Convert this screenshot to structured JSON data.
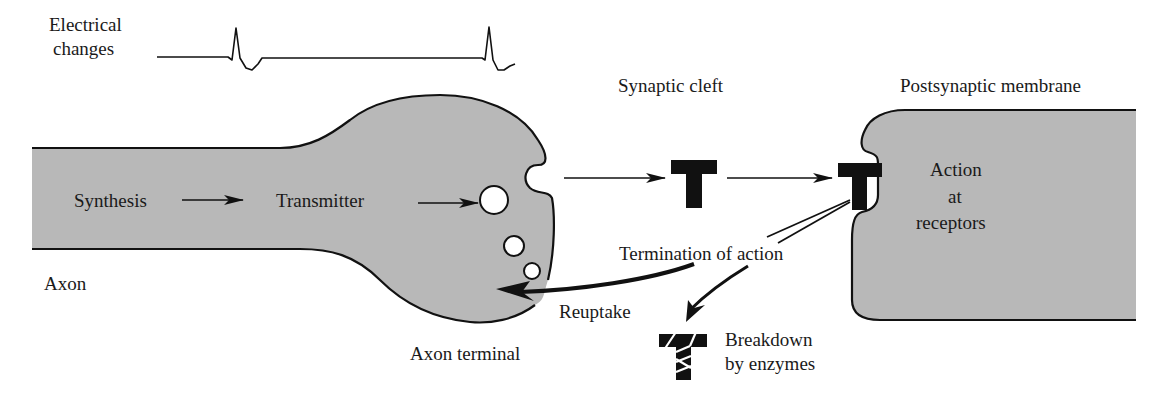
{
  "diagram": {
    "type": "synaptic-transmission",
    "colors": {
      "membrane_fill": "#b8b8b8",
      "outline": "#111111",
      "vesicle_fill": "#ffffff",
      "background": "#ffffff"
    }
  },
  "labels": {
    "electrical_line1": "Electrical",
    "electrical_line2": "changes",
    "synaptic_cleft": "Synaptic cleft",
    "postsynaptic_membrane": "Postsynaptic membrane",
    "synthesis": "Synthesis",
    "transmitter": "Transmitter",
    "axon": "Axon",
    "axon_terminal": "Axon terminal",
    "action_line1": "Action",
    "action_line2": "at",
    "action_line3": "receptors",
    "termination": "Termination of action",
    "reuptake": "Reuptake",
    "breakdown_line1": "Breakdown",
    "breakdown_line2": "by enzymes"
  },
  "nodes": [
    {
      "id": "axon",
      "label": "Axon"
    },
    {
      "id": "axon-terminal",
      "label": "Axon terminal"
    },
    {
      "id": "synaptic-cleft",
      "label": "Synaptic cleft"
    },
    {
      "id": "postsynaptic-membrane",
      "label": "Postsynaptic membrane"
    },
    {
      "id": "synthesis",
      "label": "Synthesis"
    },
    {
      "id": "transmitter",
      "label": "Transmitter"
    },
    {
      "id": "receptor-action",
      "label": "Action at receptors"
    },
    {
      "id": "reuptake",
      "label": "Reuptake"
    },
    {
      "id": "enzymatic-breakdown",
      "label": "Breakdown by enzymes"
    }
  ],
  "edges": [
    {
      "from": "synthesis",
      "to": "transmitter"
    },
    {
      "from": "transmitter",
      "to": "vesicle"
    },
    {
      "from": "axon-terminal",
      "to": "transmitter-in-cleft"
    },
    {
      "from": "transmitter-in-cleft",
      "to": "receptor-action"
    },
    {
      "from": "receptor-action",
      "to": "axon-terminal",
      "label": "Reuptake"
    },
    {
      "from": "receptor-action",
      "to": "enzymatic-breakdown"
    }
  ]
}
